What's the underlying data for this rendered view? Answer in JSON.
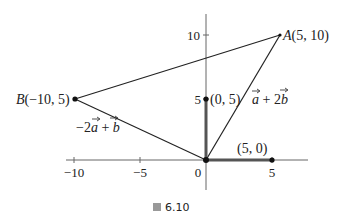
{
  "figure": {
    "caption_prefix": "圖",
    "caption_number": "6.10"
  },
  "axes": {
    "x_ticks": [
      {
        "value": -10,
        "label": "−10"
      },
      {
        "value": -5,
        "label": "−5"
      },
      {
        "value": 0,
        "label": "0"
      },
      {
        "value": 5,
        "label": "5"
      }
    ],
    "y_ticks": [
      {
        "value": 5,
        "label": "5"
      },
      {
        "value": 10,
        "label": "10"
      }
    ]
  },
  "points": {
    "A": {
      "name": "A",
      "coords": "(5, 10)",
      "x": 5,
      "y": 10
    },
    "B": {
      "name": "B",
      "coords": "(−10, 5)",
      "x": -10,
      "y": 5
    },
    "P1": {
      "label": "(0, 5)",
      "x": 0,
      "y": 5
    },
    "P2": {
      "label": "(5, 0)",
      "x": 5,
      "y": 0
    },
    "O": {
      "x": 0,
      "y": 0
    }
  },
  "vectors": {
    "OA_label_a": "a",
    "OA_label_rest": " + 2",
    "OA_label_b": "b",
    "OB_label_coef": "−2",
    "OB_label_a": "a",
    "OB_label_plus": " + ",
    "OB_label_b": "b"
  },
  "colors": {
    "axis": "#555555",
    "line": "#222222",
    "vector_thick": "#555555"
  }
}
